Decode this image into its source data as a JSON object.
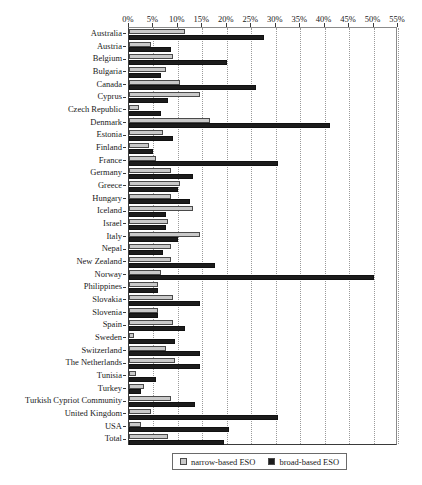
{
  "chart_data": {
    "type": "bar",
    "orientation": "horizontal",
    "title": "",
    "subtitle": "",
    "xlabel": "",
    "ylabel": "",
    "xlim": [
      0,
      55
    ],
    "xtick_labels": [
      "0%",
      "5%",
      "10%",
      "15%",
      "20%",
      "25%",
      "30%",
      "35%",
      "40%",
      "45%",
      "50%",
      "55%"
    ],
    "xtick_values": [
      0,
      5,
      10,
      15,
      20,
      25,
      30,
      35,
      40,
      45,
      50,
      55
    ],
    "grid": true,
    "grid_axis": "x",
    "legend_position": "bottom-center",
    "categories": [
      "Australia",
      "Austria",
      "Belgium",
      "Bulgaria",
      "Canada",
      "Cyprus",
      "Czech Republic",
      "Denmark",
      "Estonia",
      "Finland",
      "France",
      "Germany",
      "Greece",
      "Hungary",
      "Iceland",
      "Israel",
      "Italy",
      "Nepal",
      "New Zealand",
      "Norway",
      "Philippines",
      "Slovakia",
      "Slovenia",
      "Spain",
      "Sweden",
      "Switzerland",
      "The Netherlands",
      "Tunisia",
      "Turkey",
      "Turkish Cypriot Community",
      "United Kingdom",
      "USA",
      "Total"
    ],
    "series": [
      {
        "name": "narrow-based ESO",
        "color": "#c9c9c9",
        "values": [
          11.5,
          4.5,
          9.0,
          7.5,
          10.5,
          14.5,
          2.0,
          16.5,
          7.0,
          4.0,
          5.5,
          8.5,
          10.5,
          8.5,
          13.0,
          8.0,
          14.5,
          8.5,
          8.5,
          6.5,
          6.0,
          9.0,
          6.0,
          9.0,
          1.0,
          7.5,
          9.5,
          1.5,
          3.0,
          8.5,
          4.5,
          2.5,
          8.0
        ]
      },
      {
        "name": "broad-based ESO",
        "color": "#1c1c1c",
        "values": [
          27.5,
          8.5,
          20.0,
          6.5,
          26.0,
          8.0,
          6.5,
          41.0,
          9.0,
          5.0,
          30.5,
          13.0,
          10.0,
          12.5,
          7.5,
          7.5,
          10.0,
          7.0,
          17.5,
          50.0,
          6.0,
          14.5,
          6.0,
          11.5,
          9.5,
          14.5,
          14.5,
          5.5,
          2.5,
          13.5,
          30.5,
          20.5,
          19.5
        ]
      }
    ]
  },
  "legend": {
    "entries": [
      {
        "label": "narrow-based ESO",
        "swatch": "#c9c9c9"
      },
      {
        "label": "broad-based ESO",
        "swatch": "#1c1c1c"
      }
    ]
  }
}
